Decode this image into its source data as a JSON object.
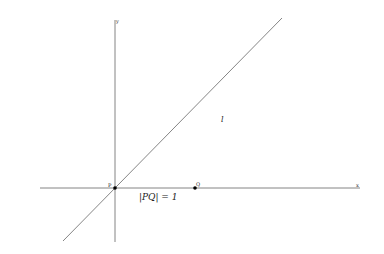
{
  "diagram": {
    "axes": {
      "x_label": "x",
      "y_label": "y"
    },
    "points": [
      {
        "name": "P",
        "label": "P"
      },
      {
        "name": "Q",
        "label": "Q"
      }
    ],
    "line_label": "l",
    "annotation": "|PQ| = 1",
    "colors": {
      "line": "#555555",
      "axis": "#555555",
      "point": "#000000"
    }
  }
}
